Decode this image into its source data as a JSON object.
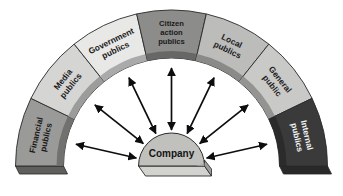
{
  "diagram": {
    "center": {
      "label": "Company",
      "fill": "#c0c0bd",
      "stroke": "#2a2a2a"
    },
    "background": "#ffffff",
    "arrow_color": "#0d0d0d",
    "arrow_style": "double-headed",
    "arrow_count": 7,
    "segments": [
      {
        "id": "financial-publics",
        "lines": [
          "Financial",
          "publics"
        ],
        "fill": "#9a9a98",
        "text_color": "#1a1a1a",
        "angle_start": 180,
        "angle_end": 154.3
      },
      {
        "id": "media-publics",
        "lines": [
          "Media",
          "publics"
        ],
        "fill": "#d5d5d3",
        "text_color": "#1a1a1a",
        "angle_start": 154.3,
        "angle_end": 128.6
      },
      {
        "id": "government-publics",
        "lines": [
          "Government",
          "publics"
        ],
        "fill": "#e8e8e6",
        "text_color": "#1a1a1a",
        "angle_start": 128.6,
        "angle_end": 102.9
      },
      {
        "id": "citizen-action-publics",
        "lines": [
          "Citizen",
          "action",
          "publics"
        ],
        "fill": "#8c8c8a",
        "text_color": "#1a1a1a",
        "angle_start": 102.9,
        "angle_end": 77.1
      },
      {
        "id": "local-publics",
        "lines": [
          "Local",
          "publics"
        ],
        "fill": "#bcbcba",
        "text_color": "#1a1a1a",
        "angle_start": 77.1,
        "angle_end": 51.4
      },
      {
        "id": "general-public",
        "lines": [
          "General",
          "public"
        ],
        "fill": "#c9c9c7",
        "text_color": "#1a1a1a",
        "angle_start": 51.4,
        "angle_end": 25.7
      },
      {
        "id": "internal-publics",
        "lines": [
          "Internal",
          "publics"
        ],
        "fill": "#3a3a3a",
        "text_color": "#f2f2f2",
        "angle_start": 25.7,
        "angle_end": 0
      }
    ]
  }
}
